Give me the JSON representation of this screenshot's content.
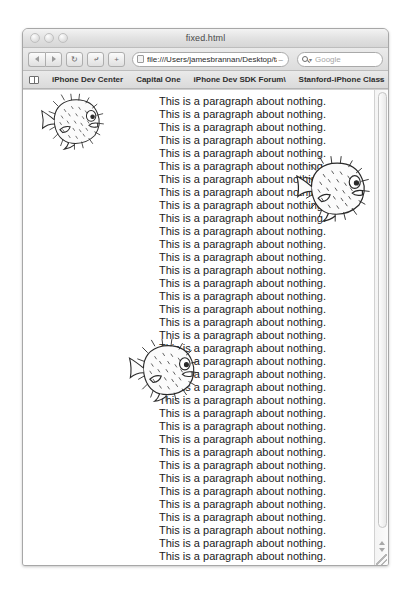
{
  "window": {
    "title": "fixed.html",
    "traffic_lights": [
      "close",
      "minimize",
      "zoom"
    ]
  },
  "toolbar": {
    "back_label": "◀",
    "forward_label": "▶",
    "reload_label": "↻",
    "snapback_label": "⤶",
    "add_label": "+",
    "url_value": "file:///Users/jamesbrannan/Desktop/tas",
    "url_truncation": "–",
    "search_placeholder": "Google",
    "search_caret": "▾"
  },
  "bookmarks": {
    "items": [
      {
        "label": "iPhone Dev Center"
      },
      {
        "label": "Capital One"
      },
      {
        "label": "iPhone Dev SDK Forum\\"
      },
      {
        "label": "Stanford-iPhone Class"
      }
    ],
    "overflow_label": "»"
  },
  "content": {
    "paragraph_text": "This is a paragraph about nothing.",
    "paragraph_count": 37,
    "images": [
      {
        "name": "pufferfish-1",
        "alt": "pufferfish",
        "left": 6,
        "top": 2,
        "width": 88,
        "height": 58
      },
      {
        "name": "pufferfish-2",
        "alt": "pufferfish",
        "left": 268,
        "top": 62,
        "width": 85,
        "height": 72
      },
      {
        "name": "pufferfish-3",
        "alt": "pufferfish",
        "left": 98,
        "top": 247,
        "width": 87,
        "height": 65
      }
    ]
  },
  "scrollbar": {
    "up_arrow": "▲",
    "down_arrow": "▼",
    "thumb_position": "top"
  },
  "colors": {
    "page_background": "#ffffff",
    "chrome": "#e2e2e2",
    "text": "#1b1b1b",
    "border": "#a7a7a7"
  }
}
